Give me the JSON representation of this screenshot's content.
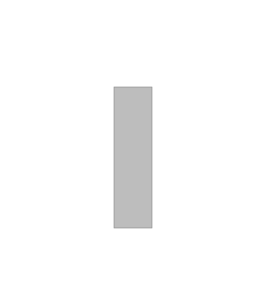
{
  "diagram": {
    "magnet": {
      "north_label": "N",
      "south_label": "S",
      "fill_color": "#b9b9b9",
      "internal_line_count": 9
    },
    "field_lines": {
      "color": "#555555",
      "arrow_direction": "outward from N at top, inward to S at bottom, downward along side loops",
      "top_fan_count": 7,
      "bottom_fan_count": 7,
      "side_loops_per_side": 3
    },
    "background_color": "#ffffff"
  }
}
